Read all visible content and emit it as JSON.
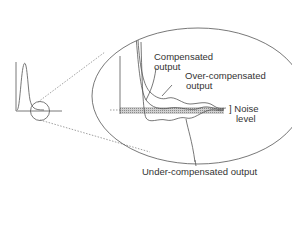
{
  "diagram": {
    "labels": {
      "compensated": [
        "Compensated",
        "output"
      ],
      "over_compensated": [
        "Over-compensated",
        "output"
      ],
      "noise": [
        "] Noise",
        "level"
      ],
      "under_compensated": "Under-compensated output"
    },
    "colors": {
      "line": "#555555",
      "noise_band": "#9a9a9a",
      "background": "#ffffff"
    }
  }
}
